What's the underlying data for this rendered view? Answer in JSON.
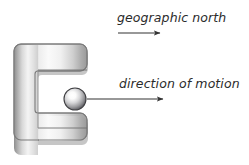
{
  "figure": {
    "type": "physics-diagram",
    "background_color": "#ffffff",
    "width": 249,
    "height": 165
  },
  "labels": {
    "north": {
      "text": "geographic north",
      "style": "italic",
      "color": "#2b2b2b",
      "x": 117,
      "y": 10
    },
    "motion": {
      "text": "direction of motion",
      "style": "italic",
      "color": "#2b2b2b",
      "x": 119,
      "y": 76
    }
  },
  "arrows": {
    "north": {
      "name": "geographic-north-arrow",
      "x1": 118,
      "y1": 33,
      "x2": 163,
      "y2": 33,
      "color": "#333333"
    },
    "motion": {
      "name": "direction-of-motion-arrow",
      "x1": 88,
      "y1": 99,
      "x2": 166,
      "y2": 99,
      "color": "#333333"
    }
  },
  "magnet": {
    "name": "horseshoe-magnet",
    "shape": "C",
    "outline_color": "#777777",
    "fill_light": "#f6f6f6",
    "fill_mid": "#c9c9c9",
    "fill_dark": "#8a8a8a",
    "shadow_color": "#b9b9b9",
    "bounds": {
      "x": 15,
      "y": 44,
      "width": 86,
      "height": 108
    },
    "gap": {
      "x": 38,
      "y": 69,
      "width": 63,
      "height": 58
    }
  },
  "ball": {
    "name": "metal-sphere",
    "cx": 75,
    "cy": 99,
    "r": 11,
    "highlight_color": "#ffffff",
    "mid_color": "#c0c0c2",
    "edge_color": "#4f4f52",
    "outline_color": "#3f3f42"
  }
}
